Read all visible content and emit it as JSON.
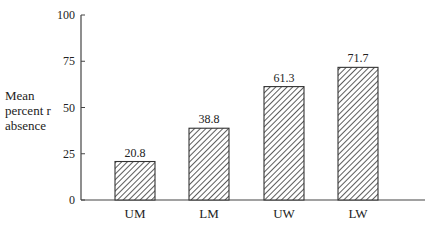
{
  "chart_data": {
    "type": "bar",
    "title": "",
    "xlabel": "",
    "ylabel": "Mean percent r absence",
    "ylabel_lines": [
      "Mean",
      "percent r",
      "absence"
    ],
    "categories": [
      "UM",
      "LM",
      "UW",
      "LW"
    ],
    "values": [
      20.8,
      38.8,
      61.3,
      71.7
    ],
    "value_labels": [
      "20.8",
      "38.8",
      "61.3",
      "71.7"
    ],
    "ylim": [
      0,
      100
    ],
    "yticks": [
      0,
      25,
      50,
      75,
      100
    ],
    "ytick_labels": [
      "0",
      "25",
      "50",
      "75",
      "100"
    ],
    "grid": false,
    "legend": null,
    "bar_fill": "diagonal-hatch",
    "bar_color": "#333333"
  }
}
